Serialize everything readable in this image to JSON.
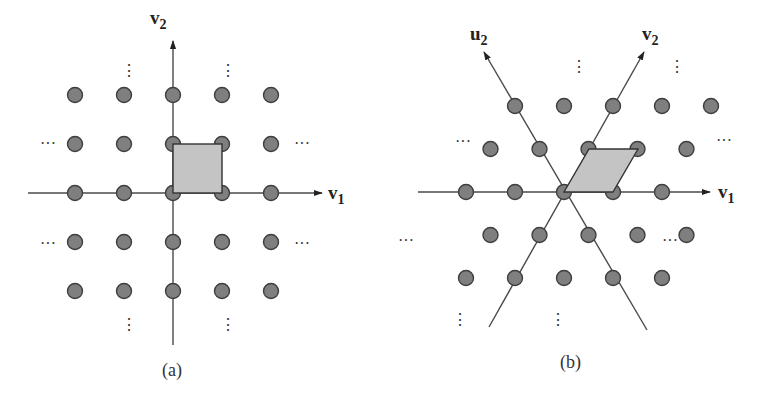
{
  "figure": {
    "panels": [
      {
        "id": "a",
        "caption": "(a)",
        "lattice": "square",
        "basis": [
          {
            "name": "v",
            "subscript": "1",
            "vector": [
              1,
              0
            ]
          },
          {
            "name": "v",
            "subscript": "2",
            "vector": [
              0,
              1
            ]
          }
        ],
        "points_range": {
          "i": [
            -2,
            2
          ],
          "j": [
            -2,
            2
          ]
        },
        "fundamental_cell": "square spanned by v1 and v2",
        "ellipsis_horizontal": "···",
        "ellipsis_vertical": "⋮"
      },
      {
        "id": "b",
        "caption": "(b)",
        "lattice": "hexagonal",
        "basis": [
          {
            "name": "v",
            "subscript": "1",
            "vector": [
              1,
              0
            ]
          },
          {
            "name": "v",
            "subscript": "2",
            "vector": [
              0.5,
              0.866
            ]
          },
          {
            "name": "u",
            "subscript": "2",
            "vector": [
              -0.5,
              0.866
            ]
          }
        ],
        "fundamental_cell": "parallelogram spanned by v1 and v2",
        "ellipsis_horizontal": "···",
        "ellipsis_vertical": "⋮"
      }
    ]
  }
}
